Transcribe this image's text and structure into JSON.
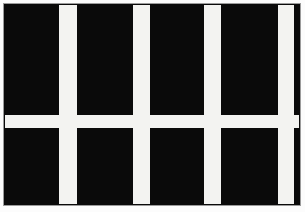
{
  "figure": {
    "canvas": {
      "width": 305,
      "height": 212,
      "background": "#fcfcfc"
    },
    "flag": {
      "left": 3,
      "top": 3,
      "width": 298,
      "height": 203,
      "fill": "#0a0a0a",
      "border_color": "#9b9b9b",
      "border_width": 1
    },
    "stripe_color": "#f3f3f1",
    "vertical_stripes": [
      {
        "left": 55,
        "width": 18
      },
      {
        "left": 129,
        "width": 17
      },
      {
        "left": 200,
        "width": 17
      },
      {
        "left": 274,
        "width": 16
      }
    ],
    "horizontal_stripes": [
      {
        "top": 111,
        "height": 13
      }
    ]
  }
}
